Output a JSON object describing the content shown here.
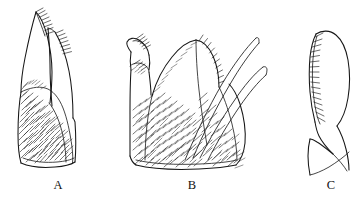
{
  "figure": {
    "kind": "scientific-line-drawing-plate",
    "background_color": "#ffffff",
    "ink_color": "#161616",
    "width": 364,
    "height": 204,
    "panel_count": 3
  },
  "panels": [
    {
      "id": "A",
      "label": "A",
      "label_x": 58,
      "label_y": 188,
      "description": "Elongate two-lobed appendage with dense setal brush on left face and two slender apical digits bearing comb rows of short spines",
      "features": {
        "apical_digits": 2,
        "comb_rows": 2,
        "setal_brush": true,
        "long_spines": 0
      }
    },
    {
      "id": "B",
      "label": "B",
      "label_x": 192,
      "label_y": 188,
      "description": "Broad densely setose appendage with a small setose lateral lobe bearing two comb tufts, a large median setose lobe, and two long curved apical spines directed upper-right",
      "features": {
        "apical_digits": 2,
        "comb_rows": 2,
        "setal_brush": true,
        "long_spines": 2
      }
    },
    {
      "id": "C",
      "label": "C",
      "label_x": 331,
      "label_y": 188,
      "description": "Narrow curved lobe with a single long row of comb-like spines along its left margin and a slender tapering basal process",
      "features": {
        "apical_digits": 0,
        "comb_rows": 1,
        "setal_brush": false,
        "long_spines": 1
      }
    }
  ]
}
